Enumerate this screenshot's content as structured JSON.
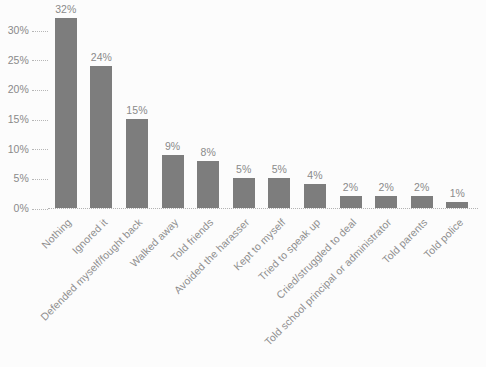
{
  "chart_data": {
    "type": "bar",
    "title": "",
    "subtitle": "",
    "xlabel": "",
    "ylabel": "",
    "ylim": [
      0,
      32
    ],
    "grid": false,
    "legend": null,
    "value_suffix": "%",
    "categories": [
      "Nothing",
      "Ignored it",
      "Defended myself/fought back",
      "Walked away",
      "Told friends",
      "Avoided the harasser",
      "Kept to myself",
      "Tried to speak up",
      "Cried/struggled to deal",
      "Told school principal or administrator",
      "Told parents",
      "Told police"
    ],
    "values": [
      32,
      24,
      15,
      9,
      8,
      5,
      5,
      4,
      2,
      2,
      2,
      1
    ],
    "value_labels": [
      "32%",
      "24%",
      "15%",
      "9%",
      "8%",
      "5%",
      "5%",
      "4%",
      "2%",
      "2%",
      "2%",
      "1%"
    ],
    "y_ticks": [
      0,
      5,
      10,
      15,
      20,
      25,
      30
    ],
    "y_tick_labels": [
      "0%",
      "5%",
      "10%",
      "15%",
      "20%",
      "25%",
      "30%"
    ],
    "colors": {
      "bar": "#7d7d7d",
      "background": "#fcfcfc",
      "tick_text": "#8a8a8a",
      "label_text": "#8f8f8f",
      "axis_line": "#b3b3b3"
    }
  }
}
